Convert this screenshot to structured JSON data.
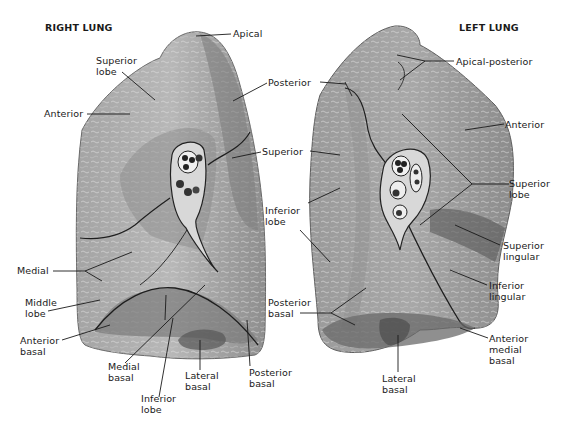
{
  "titles": {
    "right": "RIGHT LUNG",
    "left": "LEFT LUNG"
  },
  "colors": {
    "background": "#ffffff",
    "lung_light": "#b9b9b9",
    "lung_mid": "#9a9a9a",
    "lung_dark": "#6e6e6e",
    "fissure": "#1e1e1e",
    "label_text": "#1a1a1a"
  },
  "right_lung": {
    "labels": {
      "apical": "Apical",
      "superior_lobe": "Superior\nlobe",
      "anterior": "Anterior",
      "posterior": "Posterior",
      "superior": "Superior",
      "medial": "Medial",
      "middle_lobe": "Middle\nlobe",
      "anterior_basal": "Anterior\nbasal",
      "medial_basal": "Medial\nbasal",
      "inferior_lobe": "Inferior\nlobe",
      "lateral_basal": "Lateral\nbasal",
      "posterior_basal": "Posterior\nbasal"
    }
  },
  "left_lung": {
    "labels": {
      "apical_posterior": "Apical-posterior",
      "anterior": "Anterior",
      "superior_lobe": "Superior\nlobe",
      "superior_lingular": "Superior\nlingular",
      "inferior_lingular": "Inferior\nlingular",
      "anterior_medial_basal": "Anterior\nmedial\nbasal",
      "lateral_basal": "Lateral\nbasal",
      "inferior_lobe": "Inferior\nlobe",
      "posterior_basal": "Posterior\nbasal"
    }
  }
}
